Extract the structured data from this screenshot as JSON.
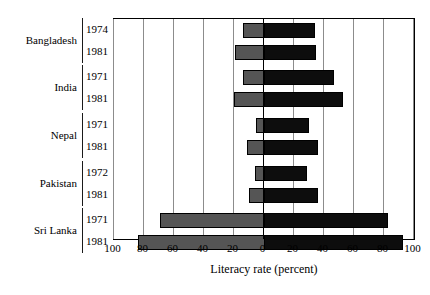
{
  "chart_data": {
    "type": "bar",
    "orientation": "horizontal",
    "subtype": "diverging-population-pyramid",
    "title": "",
    "xlabel": "Literacy rate (percent)",
    "ylabel": "",
    "xlim": [
      -100,
      100
    ],
    "xticks": [
      -100,
      -80,
      -60,
      -40,
      -20,
      0,
      20,
      40,
      60,
      80,
      100
    ],
    "xtick_labels": [
      "100",
      "80",
      "60",
      "40",
      "20",
      "0",
      "20",
      "40",
      "60",
      "80",
      "100"
    ],
    "grid": true,
    "legend": "none",
    "series": [
      {
        "name": "left-series",
        "color": "#555555"
      },
      {
        "name": "right-series",
        "color": "#0d0d0d"
      }
    ],
    "groups": [
      {
        "country": "Bangladesh",
        "rows": [
          {
            "year": "1974",
            "left": 14,
            "right": 34
          },
          {
            "year": "1981",
            "left": 19,
            "right": 35
          }
        ]
      },
      {
        "country": "India",
        "rows": [
          {
            "year": "1971",
            "left": 14,
            "right": 47
          },
          {
            "year": "1981",
            "left": 20,
            "right": 53
          }
        ]
      },
      {
        "country": "Nepal",
        "rows": [
          {
            "year": "1971",
            "left": 5,
            "right": 30
          },
          {
            "year": "1981",
            "left": 11,
            "right": 36
          }
        ]
      },
      {
        "country": "Pakistan",
        "rows": [
          {
            "year": "1972",
            "left": 6,
            "right": 29
          },
          {
            "year": "1981",
            "left": 10,
            "right": 36
          }
        ]
      },
      {
        "country": "Sri Lanka",
        "rows": [
          {
            "year": "1971",
            "left": 69,
            "right": 83
          },
          {
            "year": "1981",
            "left": 84,
            "right": 93
          }
        ]
      }
    ]
  },
  "axis": {
    "title": "Literacy rate (percent)",
    "ticks": [
      "100",
      "80",
      "60",
      "40",
      "20",
      "0",
      "20",
      "40",
      "60",
      "80",
      "100"
    ]
  },
  "labels": {
    "countries": [
      "Bangladesh",
      "India",
      "Nepal",
      "Pakistan",
      "Sri Lanka"
    ],
    "years": [
      [
        "1974",
        "1981"
      ],
      [
        "1971",
        "1981"
      ],
      [
        "1971",
        "1981"
      ],
      [
        "1972",
        "1981"
      ],
      [
        "1971",
        "1981"
      ]
    ]
  }
}
